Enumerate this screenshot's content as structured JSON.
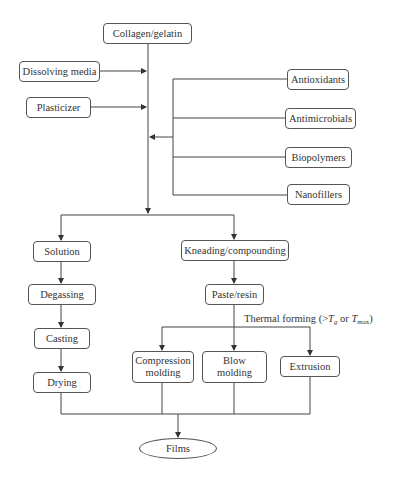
{
  "diagram": {
    "type": "flowchart",
    "title": "",
    "nodes": {
      "collagen": "Collagen/gelatin",
      "dissolving_media": "Dissolving media",
      "plasticizer": "Plasticizer",
      "antioxidants": "Antioxidants",
      "antimicrobials": "Antimicrobials",
      "biopolymers": "Biopolymers",
      "nanofillers": "Nanofillers",
      "solution": "Solution",
      "degassing": "Degassing",
      "casting": "Casting",
      "drying": "Drying",
      "kneading": "Kneading/compounding",
      "paste": "Paste/resin",
      "compression": "Compression molding",
      "blow": "Blow molding",
      "extrusion": "Extrusion",
      "films": "Films"
    },
    "thermal_label": {
      "prefix": "Thermal forming (>",
      "tg_main": "T",
      "tg_sub": "g",
      "middle": " or ",
      "tmax_main": "T",
      "tmax_sub": "max",
      "suffix": ")"
    },
    "edges": [
      [
        "Collagen/gelatin",
        "main-line"
      ],
      [
        "Dissolving media",
        "main-line"
      ],
      [
        "Plasticizer",
        "main-line"
      ],
      [
        "Antioxidants|Antimicrobials|Biopolymers|Nanofillers",
        "main-line"
      ],
      [
        "main-line",
        "Solution"
      ],
      [
        "main-line",
        "Kneading/compounding"
      ],
      [
        "Solution",
        "Degassing"
      ],
      [
        "Degassing",
        "Casting"
      ],
      [
        "Casting",
        "Drying"
      ],
      [
        "Kneading/compounding",
        "Paste/resin"
      ],
      [
        "Paste/resin",
        "Compression molding"
      ],
      [
        "Paste/resin",
        "Blow molding"
      ],
      [
        "Paste/resin",
        "Extrusion"
      ],
      [
        "Drying|Compression molding|Blow molding|Extrusion",
        "Films"
      ]
    ],
    "colors": {
      "line": "#444444",
      "border": "#555555",
      "text": "#333333",
      "background": "#ffffff"
    }
  }
}
